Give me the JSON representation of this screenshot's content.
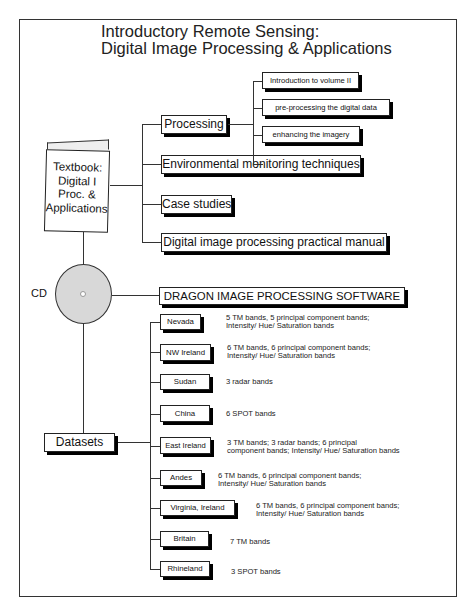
{
  "title": {
    "line1": "Introductory Remote Sensing:",
    "line2": "Digital Image Processing & Applications"
  },
  "textbook": {
    "label_lines": [
      "Textbook:",
      "Digital I",
      "Proc. &",
      "Applications"
    ],
    "icon": "book-icon",
    "branches": [
      {
        "label": "Processing"
      },
      {
        "label": "Environmental monitoring techniques"
      },
      {
        "label": "Case studies"
      },
      {
        "label": "Digital image processing practical manual"
      }
    ],
    "processing_children": [
      {
        "label": "Introduction to volume II"
      },
      {
        "label": "pre-processing the digital data"
      },
      {
        "label": "enhancing the imagery"
      }
    ]
  },
  "cd": {
    "label": "CD",
    "icon": "disc-icon",
    "software": "DRAGON IMAGE PROCESSING SOFTWARE"
  },
  "datasets": {
    "label": "Datasets",
    "items": [
      {
        "name": "Nevada",
        "desc1": "5 TM bands, 5 principal component bands;",
        "desc2": "Intensity/ Hue/ Saturation bands"
      },
      {
        "name": "NW Ireland",
        "desc1": "6 TM bands, 6 principal component bands;",
        "desc2": "Intensity/ Hue/ Saturation bands"
      },
      {
        "name": "Sudan",
        "desc1": "3 radar bands",
        "desc2": ""
      },
      {
        "name": "China",
        "desc1": "6 SPOT bands",
        "desc2": ""
      },
      {
        "name": "East Ireland",
        "desc1": "3 TM bands; 3 radar bands; 6 principal",
        "desc2": "component bands; Intensity/ Hue/ Saturation bands"
      },
      {
        "name": "Andes",
        "desc1": "6 TM bands, 6 principal component bands;",
        "desc2": "Intensity/ Hue/ Saturation bands"
      },
      {
        "name": "Virginia, Ireland",
        "desc1": "6 TM bands, 6 principal component bands;",
        "desc2": "Intensity/ Hue/ Saturation bands"
      },
      {
        "name": "Britain",
        "desc1": "7 TM bands",
        "desc2": ""
      },
      {
        "name": "Rhineland",
        "desc1": "3 SPOT bands",
        "desc2": ""
      }
    ]
  }
}
